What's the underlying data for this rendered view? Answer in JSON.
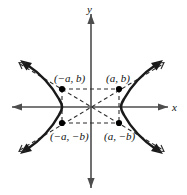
{
  "figure": {
    "kind": "hyperbola-diagram",
    "colors": {
      "curve": "#1a1a1a",
      "axis": "#4d4d4d",
      "dashed": "#2b2b2b",
      "point": "#000000",
      "background": "#ffffff"
    },
    "axes": {
      "x_label": "x",
      "y_label": "y",
      "origin": {
        "x": 91,
        "y": 107
      }
    },
    "points": [
      {
        "id": "top-left",
        "label": "(−a, b)",
        "x": 62,
        "y": 89
      },
      {
        "id": "top-right",
        "label": "(a, b)",
        "x": 119,
        "y": 89
      },
      {
        "id": "bottom-left",
        "label": "(−a, −b)",
        "x": 62,
        "y": 123
      },
      {
        "id": "bottom-right",
        "label": "(a, −b)",
        "x": 119,
        "y": 123
      }
    ],
    "parameters": {
      "a": 29,
      "b": 18
    }
  }
}
